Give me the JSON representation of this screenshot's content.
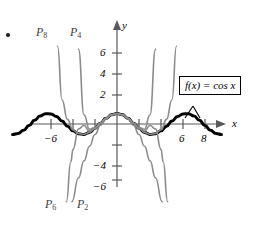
{
  "figure": {
    "bullet_marker": "•",
    "axis_labels": {
      "x": "x",
      "y": "y"
    },
    "callout_label": "f(x) = cos x",
    "colors": {
      "function_curve": "#000000",
      "polynomial_curve": "#8c8c8c",
      "axis": "#595959",
      "text": "#000000"
    },
    "polynomial_labels": [
      {
        "name": "P8",
        "base": "P",
        "sub": "8"
      },
      {
        "name": "P4",
        "base": "P",
        "sub": "4"
      },
      {
        "name": "P6",
        "base": "P",
        "sub": "6"
      },
      {
        "name": "P2",
        "base": "P",
        "sub": "2"
      }
    ],
    "x_tick_labels": [
      {
        "value": -6,
        "text": "−6"
      },
      {
        "value": 6,
        "text": "6"
      },
      {
        "value": 8,
        "text": "8"
      }
    ],
    "y_tick_labels": [
      {
        "value": 6,
        "text": "6"
      },
      {
        "value": 4,
        "text": "4"
      },
      {
        "value": 2,
        "text": "2"
      },
      {
        "value": -4,
        "text": "−4"
      },
      {
        "value": -6,
        "text": "−6"
      }
    ]
  },
  "chart_data": {
    "type": "line",
    "title": "",
    "xlabel": "x",
    "ylabel": "y",
    "xlim": [
      -9.5,
      9.5
    ],
    "ylim": [
      -7.6,
      7.6
    ],
    "grid": false,
    "legend": "inline-labels",
    "x_ticks": [
      -8,
      -6,
      -4,
      -2,
      2,
      4,
      6,
      8
    ],
    "x_tick_labels_shown": [
      "-6",
      "6",
      "8"
    ],
    "y_ticks": [
      -6,
      -4,
      -2,
      2,
      4,
      6
    ],
    "y_tick_labels_shown": [
      "6",
      "4",
      "2",
      "-4",
      "-6"
    ],
    "annotations": [
      {
        "text": "f(x) = cos x",
        "target_x": 6.6,
        "target_y": 0.75
      }
    ],
    "series": [
      {
        "name": "f(x) = cos x",
        "expression": "cos(x)",
        "color": "#000000",
        "width": 3,
        "x": [
          -9.5,
          -9,
          -8.5,
          -8,
          -7.5,
          -7,
          -6.5,
          -6,
          -5.5,
          -5,
          -4.5,
          -4,
          -3.5,
          -3,
          -2.5,
          -2,
          -1.5,
          -1,
          -0.5,
          0,
          0.5,
          1,
          1.5,
          2,
          2.5,
          3,
          3.5,
          4,
          4.5,
          5,
          5.5,
          6,
          6.5,
          7,
          7.5,
          8,
          8.5,
          9,
          9.5
        ],
        "y": [
          -0.997,
          -0.911,
          -0.602,
          -0.146,
          0.347,
          0.754,
          0.977,
          0.96,
          0.709,
          0.284,
          -0.211,
          -0.654,
          -0.936,
          -0.99,
          -0.801,
          -0.416,
          0.071,
          0.54,
          0.878,
          1,
          0.878,
          0.54,
          0.071,
          -0.416,
          -0.801,
          -0.99,
          -0.936,
          -0.654,
          -0.211,
          0.284,
          0.709,
          0.96,
          0.977,
          0.754,
          0.347,
          -0.146,
          -0.602,
          -0.911,
          -0.997
        ]
      },
      {
        "name": "P2",
        "expression": "1 - x^2/2",
        "color": "#8c8c8c",
        "width": 1.6,
        "x": [
          -4.1,
          -3.5,
          -3,
          -2.5,
          -2,
          -1.5,
          -1,
          -0.5,
          0,
          0.5,
          1,
          1.5,
          2,
          2.5,
          3,
          3.5,
          4.1
        ],
        "y": [
          -7.4,
          -5.125,
          -3.5,
          -2.125,
          -1,
          -0.125,
          0.5,
          0.875,
          1,
          0.875,
          0.5,
          -0.125,
          -1,
          -2.125,
          -3.5,
          -5.125,
          -7.4
        ]
      },
      {
        "name": "P4",
        "expression": "1 - x^2/2 + x^4/24",
        "color": "#8c8c8c",
        "width": 1.6,
        "x": [
          -3.5,
          -3,
          -2.5,
          -2,
          -1.5,
          -1,
          -0.5,
          0,
          0.5,
          1,
          1.5,
          2,
          2.5,
          3,
          3.5
        ],
        "y": [
          7.127,
          0.875,
          -0.497,
          -0.333,
          0.086,
          0.542,
          0.878,
          1,
          0.878,
          0.542,
          0.086,
          -0.333,
          -0.497,
          0.875,
          7.127
        ]
      },
      {
        "name": "P6",
        "expression": "1 - x^2/2 + x^4/24 - x^6/720",
        "color": "#8c8c8c",
        "width": 1.6,
        "x": [
          -4.6,
          -4.2,
          -4,
          -3.5,
          -3,
          -2.5,
          -2,
          -1.5,
          -1,
          -0.5,
          0,
          0.5,
          1,
          1.5,
          2,
          2.5,
          3,
          3.5,
          4,
          4.2,
          4.6
        ],
        "y": [
          -7.4,
          -3.6,
          -2.42,
          -0.46,
          -0.138,
          -0.68,
          -0.422,
          0.07,
          0.541,
          0.878,
          1,
          0.878,
          0.541,
          0.07,
          -0.422,
          -0.68,
          -0.138,
          -0.46,
          -2.42,
          -3.6,
          -7.4
        ]
      },
      {
        "name": "P8",
        "expression": "1 - x^2/2 + x^4/24 - x^6/720 + x^8/40320",
        "color": "#8c8c8c",
        "width": 1.6,
        "x": [
          -5.4,
          -5,
          -4.5,
          -4,
          -3.5,
          -3,
          -2.5,
          -2,
          -1.5,
          -1,
          -0.5,
          0,
          0.5,
          1,
          1.5,
          2,
          2.5,
          3,
          3.5,
          4,
          4.5,
          5,
          5.4
        ],
        "y": [
          7.4,
          2.31,
          0.44,
          -0.57,
          -0.91,
          -0.98,
          -0.8,
          -0.416,
          0.071,
          0.54,
          0.878,
          1,
          0.878,
          0.54,
          0.071,
          -0.416,
          -0.8,
          -0.98,
          -0.91,
          -0.57,
          0.44,
          2.31,
          7.4
        ]
      }
    ]
  }
}
